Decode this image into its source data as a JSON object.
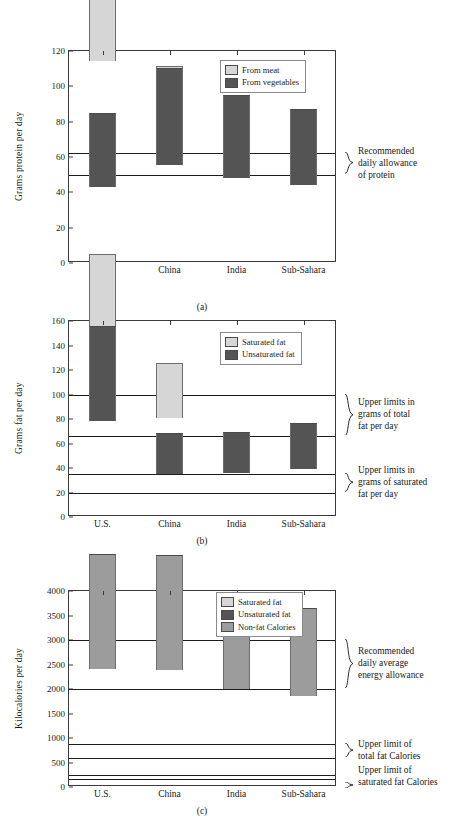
{
  "figure": {
    "colors": {
      "light_gray": "#d6d6d6",
      "dark_gray": "#545454",
      "medium_gray": "#9c9c9c",
      "axis": "#3a3a3a",
      "refline": "#1c1c1c"
    },
    "categories": [
      "U.S.",
      "China",
      "India",
      "Sub-Sahara"
    ]
  },
  "chart_data": [
    {
      "id": "a",
      "type": "bar",
      "stacked": true,
      "caption": "(a)",
      "title": "",
      "xlabel": "",
      "ylabel": "Grams protein per day",
      "ylim": [
        0,
        120
      ],
      "yticks": [
        0,
        20,
        40,
        60,
        80,
        100,
        120
      ],
      "ytick_labels": [
        "0",
        "20",
        "40",
        "60",
        "80",
        "100",
        "120"
      ],
      "grid": false,
      "legend_position": "top-right",
      "categories": [
        "U.S.",
        "China",
        "India",
        "Sub-Sahara"
      ],
      "series": [
        {
          "name": "From meat",
          "color": "#d6d6d6",
          "values": [
            71,
            28,
            9,
            10
          ]
        },
        {
          "name": "From vegetables",
          "color": "#545454",
          "values": [
            42,
            54.5,
            47,
            43
          ]
        }
      ],
      "totals": [
        113,
        82.5,
        56,
        53
      ],
      "reference_lines": [
        {
          "value": 62,
          "label": ""
        },
        {
          "value": 50,
          "label": ""
        }
      ],
      "annotations": [
        {
          "lines": [
            "Recommended",
            "daily allowance",
            "of protein"
          ],
          "span": [
            50,
            62
          ]
        }
      ]
    },
    {
      "id": "b",
      "type": "bar",
      "stacked": true,
      "caption": "(b)",
      "title": "",
      "xlabel": "",
      "ylabel": "Grams fat per day",
      "ylim": [
        0,
        160
      ],
      "yticks": [
        0,
        20,
        40,
        60,
        80,
        100,
        120,
        140,
        160
      ],
      "ytick_labels": [
        "0",
        "20",
        "40",
        "60",
        "80",
        "100",
        "120",
        "140",
        "160"
      ],
      "grid": false,
      "legend_position": "top-right",
      "categories": [
        "U.S.",
        "China",
        "India",
        "Sub-Sahara"
      ],
      "series": [
        {
          "name": "Saturated fat",
          "color": "#d6d6d6",
          "values": [
            68,
            45.5,
            11,
            7.5
          ]
        },
        {
          "name": "Unsaturated fat",
          "color": "#545454",
          "values": [
            77,
            33.5,
            34,
            37.5
          ]
        }
      ],
      "totals": [
        145,
        79,
        45,
        45
      ],
      "reference_lines": [
        {
          "value": 100,
          "label": ""
        },
        {
          "value": 66,
          "label": ""
        },
        {
          "value": 35,
          "label": ""
        },
        {
          "value": 20,
          "label": ""
        }
      ],
      "annotations": [
        {
          "lines": [
            "Upper limits in",
            "grams of total",
            "fat per day"
          ],
          "span": [
            66,
            100
          ]
        },
        {
          "lines": [
            "Upper limits in",
            "grams of saturated",
            "fat per day"
          ],
          "span": [
            20,
            35
          ]
        }
      ]
    },
    {
      "id": "c",
      "type": "bar",
      "stacked": true,
      "caption": "(c)",
      "title": "",
      "xlabel": "",
      "ylabel": "Kilocalories per day",
      "ylim": [
        0,
        4000
      ],
      "yticks": [
        0,
        500,
        1000,
        1500,
        2000,
        2500,
        3000,
        3500,
        4000
      ],
      "ytick_labels": [
        "0",
        "500",
        "1000",
        "1500",
        "2000",
        "2500",
        "3000",
        "3500",
        "4000"
      ],
      "grid": false,
      "legend_position": "top-right",
      "categories": [
        "U.S.",
        "China",
        "India",
        "Sub-Sahara"
      ],
      "series": [
        {
          "name": "Saturated fat",
          "color": "#d6d6d6",
          "values": [
            590,
            400,
            110,
            60
          ]
        },
        {
          "name": "Unsaturated fat",
          "color": "#545454",
          "values": [
            700,
            270,
            290,
            310
          ]
        },
        {
          "name": "Non-fat Calories",
          "color": "#9c9c9c",
          "values": [
            2360,
            2350,
            1960,
            1810
          ]
        }
      ],
      "totals": [
        3650,
        3020,
        2360,
        2180
      ],
      "reference_lines": [
        {
          "value": 3000,
          "label": ""
        },
        {
          "value": 2000,
          "label": ""
        },
        {
          "value": 880,
          "label": ""
        },
        {
          "value": 590,
          "label": ""
        },
        {
          "value": 250,
          "label": ""
        },
        {
          "value": 170,
          "label": ""
        }
      ],
      "annotations": [
        {
          "lines": [
            "Recommended",
            "daily average",
            "energy allowance"
          ],
          "span": [
            2000,
            3000
          ]
        },
        {
          "lines": [
            "Upper limit of",
            "total fat Calories"
          ],
          "span": [
            590,
            880
          ]
        },
        {
          "lines": [
            "Upper limit of",
            "saturated fat Calories"
          ],
          "span": [
            170,
            250
          ]
        }
      ]
    }
  ]
}
